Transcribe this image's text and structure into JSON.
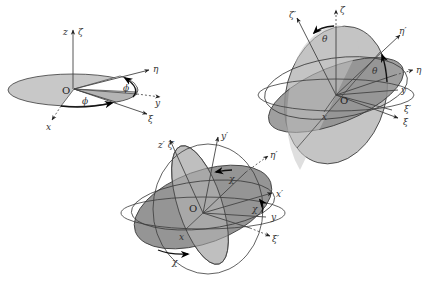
{
  "colors": {
    "light_fill": "#c8c8c8",
    "mid_fill": "#b4b4b4",
    "dark_fill": "#8a8a8a",
    "line": "#3a3a3a",
    "background": "#ffffff"
  },
  "panel1": {
    "title": "Rotation by phi about z-axis",
    "labels": {
      "z": "z",
      "zeta": "ζ",
      "eta": "η",
      "y": "y",
      "xi": "ξ",
      "x": "x",
      "origin": "O",
      "phi_top": "ϕ",
      "phi_bottom": "ϕ"
    }
  },
  "panel2": {
    "title": "Rotation by theta about xi-axis",
    "labels": {
      "zeta": "ζ",
      "zeta_prime": "ζ′",
      "theta_top": "θ",
      "eta_prime": "η′",
      "eta": "η",
      "theta_right": "θ",
      "y": "y",
      "xi_prime": "ξ′",
      "xi": "ξ",
      "origin": "O",
      "x": "x"
    }
  },
  "panel3": {
    "title": "Rotation by chi about zeta'-axis",
    "labels": {
      "z_prime_zeta_prime": "z′ ζ′",
      "y_prime": "y′",
      "eta_prime": "η′",
      "chi_top": "χ",
      "x_prime": "x′",
      "y": "y",
      "chi_right": "χ",
      "xi_prime": "ξ′",
      "origin": "O",
      "x": "x",
      "chi_bottom": "χ"
    }
  }
}
